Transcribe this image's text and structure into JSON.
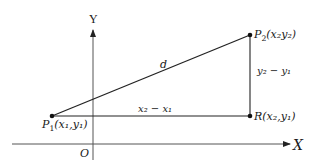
{
  "figure": {
    "axes": {
      "x_label": "X",
      "y_label": "Y",
      "origin_label": "O"
    },
    "points": {
      "p1": {
        "name": "P",
        "sub": "1",
        "coords": "(x₁,y₁)"
      },
      "p2": {
        "name": "P",
        "sub": "2",
        "coords": "(x₂y₂)"
      },
      "r": {
        "name": "R",
        "coords": "(x₂,y₁)"
      }
    },
    "segments": {
      "hypotenuse": "d",
      "horizontal": "x₂ − x₁",
      "vertical": "y₂ − y₁"
    },
    "colors": {
      "line": "#222222",
      "axis": "#555555",
      "text": "#1a1a1a"
    }
  }
}
